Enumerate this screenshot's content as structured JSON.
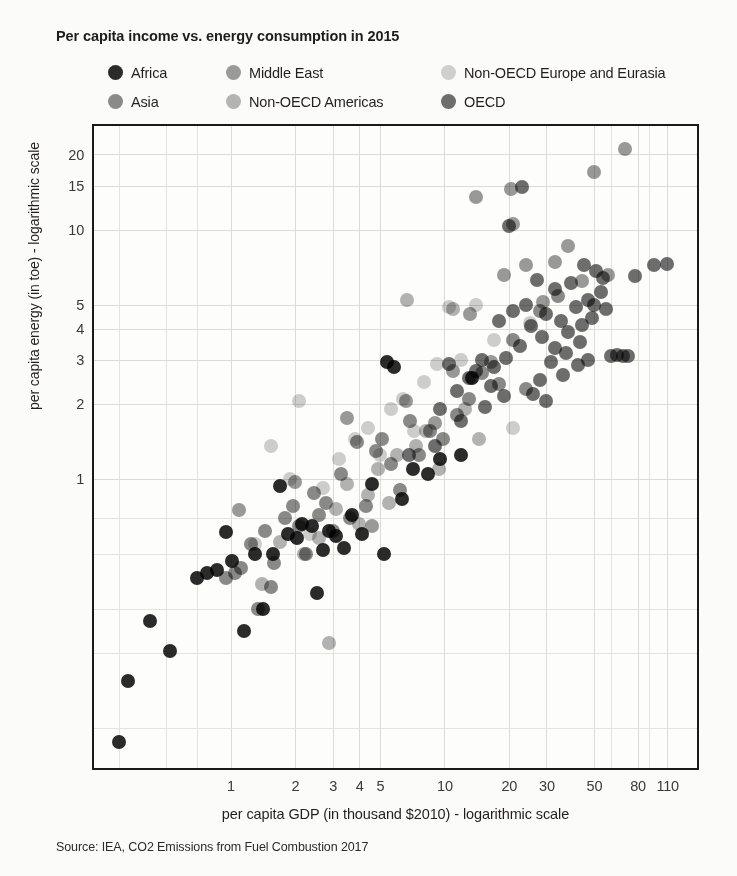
{
  "title": "Per capita income vs. energy consumption in 2015",
  "axis": {
    "x_title": "per capita GDP (in thousand $2010) - logarithmic scale",
    "y_title": "per capita energy (in toe) - logarithmic scale"
  },
  "source": "Source: IEA, CO2 Emissions from Fuel Combustion 2017",
  "legend": {
    "position": "top",
    "items": [
      {
        "label": "Africa",
        "color": "#2b2b2b"
      },
      {
        "label": "Middle East",
        "color": "#9a9a9a"
      },
      {
        "label": "Non-OECD Europe and Eurasia",
        "color": "#cfcfcf"
      },
      {
        "label": "Asia",
        "color": "#8a8a8a"
      },
      {
        "label": "Non-OECD Americas",
        "color": "#b4b4b4"
      },
      {
        "label": "OECD",
        "color": "#6e6e6e"
      }
    ]
  },
  "chart_data": {
    "type": "scatter",
    "title": "Per capita income vs. energy consumption in 2015",
    "xlabel": "per capita GDP (in thousand $2010) - logarithmic scale",
    "ylabel": "per capita energy (in toe) - logarithmic scale",
    "xscale": "log",
    "yscale": "log",
    "xlim": [
      0.23,
      150
    ],
    "ylim": [
      0.07,
      26
    ],
    "xticks": [
      1,
      2,
      3,
      4,
      5,
      10,
      20,
      30,
      50,
      80,
      110
    ],
    "xtick_labels": [
      "1",
      "2",
      "3",
      "4",
      "5",
      "10",
      "20",
      "30",
      "50",
      "80",
      "110"
    ],
    "yticks": [
      1,
      2,
      3,
      4,
      5,
      10,
      15,
      20
    ],
    "ytick_labels": [
      "1",
      "2",
      "3",
      "4",
      "5",
      "10",
      "15",
      "20"
    ],
    "grid": true,
    "legend_position": "top",
    "series": [
      {
        "name": "Africa",
        "color": "#2b2b2b",
        "points": [
          [
            0.3,
            0.088
          ],
          [
            0.42,
            0.27
          ],
          [
            0.52,
            0.205
          ],
          [
            0.7,
            0.4
          ],
          [
            0.78,
            0.42
          ],
          [
            0.86,
            0.43
          ],
          [
            0.95,
            0.61
          ],
          [
            1.02,
            0.47
          ],
          [
            1.15,
            0.245
          ],
          [
            1.3,
            0.5
          ],
          [
            1.42,
            0.3
          ],
          [
            1.58,
            0.5
          ],
          [
            1.7,
            0.94
          ],
          [
            1.85,
            0.6
          ],
          [
            2.05,
            0.58
          ],
          [
            2.15,
            0.66
          ],
          [
            2.4,
            0.65
          ],
          [
            2.55,
            0.35
          ],
          [
            2.7,
            0.52
          ],
          [
            2.9,
            0.62
          ],
          [
            3.1,
            0.59
          ],
          [
            3.4,
            0.53
          ],
          [
            3.7,
            0.72
          ],
          [
            4.1,
            0.6
          ],
          [
            4.6,
            0.95
          ],
          [
            5.2,
            0.5
          ],
          [
            5.4,
            2.95
          ],
          [
            5.8,
            2.8
          ],
          [
            6.3,
            0.83
          ],
          [
            7.1,
            1.1
          ],
          [
            8.4,
            1.05
          ],
          [
            9.5,
            1.2
          ],
          [
            12.0,
            1.25
          ],
          [
            13.5,
            2.55
          ],
          [
            0.33,
            0.155
          ]
        ]
      },
      {
        "name": "Asia",
        "color": "#8a8a8a",
        "points": [
          [
            0.95,
            0.4
          ],
          [
            1.05,
            0.42
          ],
          [
            1.12,
            0.44
          ],
          [
            1.25,
            0.55
          ],
          [
            1.35,
            0.3
          ],
          [
            1.45,
            0.62
          ],
          [
            1.6,
            0.46
          ],
          [
            1.8,
            0.7
          ],
          [
            1.95,
            0.78
          ],
          [
            2.1,
            0.65
          ],
          [
            2.25,
            0.5
          ],
          [
            2.45,
            0.88
          ],
          [
            2.6,
            0.72
          ],
          [
            2.8,
            0.8
          ],
          [
            3.0,
            0.62
          ],
          [
            3.3,
            1.05
          ],
          [
            3.6,
            0.7
          ],
          [
            3.9,
            1.4
          ],
          [
            4.3,
            0.78
          ],
          [
            4.8,
            1.3
          ],
          [
            5.1,
            1.45
          ],
          [
            5.6,
            1.15
          ],
          [
            6.2,
            0.9
          ],
          [
            6.9,
            1.7
          ],
          [
            7.6,
            1.25
          ],
          [
            8.6,
            1.55
          ],
          [
            9.8,
            1.45
          ],
          [
            11.5,
            1.8
          ],
          [
            13.0,
            2.1
          ],
          [
            15.0,
            2.65
          ],
          [
            18.0,
            2.4
          ],
          [
            21.0,
            3.6
          ],
          [
            24.0,
            2.3
          ],
          [
            28.0,
            4.7
          ],
          [
            34.0,
            5.4
          ],
          [
            1.55,
            0.37
          ]
        ]
      },
      {
        "name": "Middle East",
        "color": "#9a9a9a",
        "points": [
          [
            1.1,
            0.75
          ],
          [
            2.0,
            0.97
          ],
          [
            3.5,
            1.75
          ],
          [
            4.6,
            0.65
          ],
          [
            6.6,
            2.05
          ],
          [
            9.0,
            1.68
          ],
          [
            11.0,
            2.7
          ],
          [
            13.2,
            4.6
          ],
          [
            14.0,
            13.5
          ],
          [
            16.5,
            2.95
          ],
          [
            19.0,
            6.6
          ],
          [
            21.0,
            10.5
          ],
          [
            24.0,
            7.2
          ],
          [
            29.0,
            5.1
          ],
          [
            33.0,
            7.4
          ],
          [
            38.0,
            8.6
          ],
          [
            44.0,
            6.2
          ],
          [
            50.0,
            17.0
          ],
          [
            58.0,
            6.6
          ],
          [
            70.0,
            21.0
          ],
          [
            20.5,
            14.5
          ]
        ]
      },
      {
        "name": "Non-OECD Americas",
        "color": "#b4b4b4",
        "points": [
          [
            1.4,
            0.38
          ],
          [
            1.7,
            0.56
          ],
          [
            2.2,
            0.5
          ],
          [
            2.6,
            0.58
          ],
          [
            3.1,
            0.76
          ],
          [
            3.5,
            0.95
          ],
          [
            4.0,
            0.66
          ],
          [
            4.4,
            0.86
          ],
          [
            4.9,
            1.1
          ],
          [
            5.5,
            0.8
          ],
          [
            6.0,
            1.25
          ],
          [
            6.7,
            5.2
          ],
          [
            7.4,
            1.35
          ],
          [
            8.2,
            1.55
          ],
          [
            9.4,
            1.1
          ],
          [
            11.0,
            4.8
          ],
          [
            12.5,
            1.9
          ],
          [
            14.5,
            1.45
          ],
          [
            2.9,
            0.22
          ]
        ]
      },
      {
        "name": "Non-OECD Europe and Eurasia",
        "color": "#cfcfcf",
        "points": [
          [
            1.3,
            0.55
          ],
          [
            1.9,
            1.0
          ],
          [
            2.35,
            0.6
          ],
          [
            2.7,
            0.92
          ],
          [
            3.2,
            1.2
          ],
          [
            3.8,
            1.45
          ],
          [
            4.4,
            1.6
          ],
          [
            5.0,
            1.25
          ],
          [
            5.6,
            1.9
          ],
          [
            6.4,
            2.1
          ],
          [
            7.2,
            1.55
          ],
          [
            8.0,
            2.45
          ],
          [
            9.2,
            2.9
          ],
          [
            10.5,
            4.9
          ],
          [
            12.0,
            3.0
          ],
          [
            14.0,
            5.0
          ],
          [
            17.0,
            3.6
          ],
          [
            21.0,
            1.6
          ],
          [
            25.0,
            4.2
          ],
          [
            1.55,
            1.35
          ],
          [
            2.1,
            2.05
          ]
        ]
      },
      {
        "name": "OECD",
        "color": "#6e6e6e",
        "points": [
          [
            6.8,
            1.25
          ],
          [
            9.0,
            1.35
          ],
          [
            11.5,
            2.25
          ],
          [
            13.0,
            2.55
          ],
          [
            15.0,
            3.0
          ],
          [
            16.5,
            2.35
          ],
          [
            18.0,
            4.3
          ],
          [
            19.5,
            3.05
          ],
          [
            21.0,
            4.7
          ],
          [
            22.5,
            3.4
          ],
          [
            24.0,
            5.0
          ],
          [
            25.5,
            4.1
          ],
          [
            27.0,
            6.3
          ],
          [
            28.5,
            3.7
          ],
          [
            30.0,
            4.6
          ],
          [
            31.5,
            2.95
          ],
          [
            33.0,
            5.8
          ],
          [
            35.0,
            4.3
          ],
          [
            37.0,
            3.2
          ],
          [
            39.0,
            6.1
          ],
          [
            41.0,
            4.9
          ],
          [
            43.0,
            3.55
          ],
          [
            45.0,
            7.2
          ],
          [
            47.0,
            5.2
          ],
          [
            49.0,
            4.4
          ],
          [
            51.0,
            6.8
          ],
          [
            54.0,
            5.6
          ],
          [
            57.0,
            4.8
          ],
          [
            60.0,
            3.1
          ],
          [
            64.0,
            3.15
          ],
          [
            68.0,
            3.1
          ],
          [
            72.0,
            3.12
          ],
          [
            78.0,
            6.5
          ],
          [
            95.0,
            7.2
          ],
          [
            110.0,
            7.3
          ],
          [
            20.0,
            10.3
          ],
          [
            23.0,
            14.8
          ],
          [
            26.0,
            2.2
          ],
          [
            30.0,
            2.05
          ],
          [
            36.0,
            2.6
          ],
          [
            42.0,
            2.85
          ],
          [
            47.0,
            3.0
          ],
          [
            19.0,
            2.15
          ],
          [
            17.0,
            2.8
          ],
          [
            15.5,
            1.95
          ],
          [
            28.0,
            2.5
          ],
          [
            33.0,
            3.35
          ],
          [
            38.0,
            3.9
          ],
          [
            44.0,
            4.15
          ],
          [
            50.0,
            5.0
          ],
          [
            55.0,
            6.4
          ],
          [
            14.0,
            2.7
          ],
          [
            12.0,
            1.7
          ],
          [
            10.5,
            2.9
          ],
          [
            9.5,
            1.9
          ]
        ]
      }
    ]
  }
}
